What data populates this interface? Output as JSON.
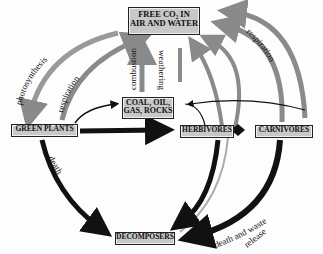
{
  "nodes": {
    "co2": {
      "line1": "FREE CO₂ IN",
      "line2": "AIR AND WATER"
    },
    "fossil": {
      "line1": "COAL, OIL,",
      "line2": "GAS, ROCKS"
    },
    "plants": {
      "label": "GREEN PLANTS"
    },
    "herbivores": {
      "label": "HERBIVORES"
    },
    "carnivores": {
      "label": "CARNIVORES"
    },
    "decomposers": {
      "label": "DECOMPOSERS"
    }
  },
  "edges": {
    "photosynthesis": "photosynthesis",
    "respiration_left": "respiration",
    "combustion": "combustion",
    "weathering": "weathering",
    "respiration_right": "respiration",
    "death": "death",
    "death_waste_1": "death and waste",
    "death_waste_2": "release"
  },
  "colors": {
    "box_fill": "#c8c8c8",
    "gray_arrow": "#8a8a8a",
    "black_arrow": "#111111"
  }
}
